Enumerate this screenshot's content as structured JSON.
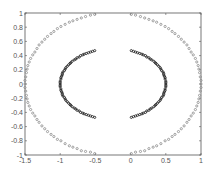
{
  "chart_data": {
    "type": "scatter",
    "title": "",
    "xlabel": "",
    "ylabel": "",
    "xlim": [
      -1.5,
      1
    ],
    "ylim": [
      -1,
      1
    ],
    "grid": false,
    "legend": null,
    "x_ticks": [
      -1.5,
      -1,
      -0.5,
      0,
      0.5,
      1
    ],
    "x_tick_labels": [
      "-1.5",
      "-1",
      "-0.5",
      "0",
      "0.5",
      "1"
    ],
    "y_ticks": [
      -1,
      -0.8,
      -0.6,
      -0.4,
      -0.2,
      0,
      0.2,
      0.4,
      0.6,
      0.8,
      1
    ],
    "y_tick_labels": [
      "-1",
      "-0.8",
      "-0.6",
      "-0.4",
      "-0.2",
      "0",
      "0.2",
      "0.4",
      "0.6",
      "0.8",
      "1"
    ],
    "series": [
      {
        "name": "outer-right",
        "color": "#8a8a8a",
        "marker": "circle",
        "points": [
          [
            0.01,
            -0.98
          ],
          [
            0.07,
            -0.96
          ],
          [
            0.14,
            -0.95
          ],
          [
            0.2,
            -0.94
          ],
          [
            0.26,
            -0.91
          ],
          [
            0.32,
            -0.89
          ],
          [
            0.37,
            -0.87
          ],
          [
            0.43,
            -0.84
          ],
          [
            0.49,
            -0.8
          ],
          [
            0.54,
            -0.78
          ],
          [
            0.59,
            -0.74
          ],
          [
            0.63,
            -0.71
          ],
          [
            0.68,
            -0.67
          ],
          [
            0.72,
            -0.63
          ],
          [
            0.76,
            -0.59
          ],
          [
            0.8,
            -0.54
          ],
          [
            0.83,
            -0.5
          ],
          [
            0.86,
            -0.45
          ],
          [
            0.89,
            -0.41
          ],
          [
            0.92,
            -0.36
          ],
          [
            0.94,
            -0.31
          ],
          [
            0.96,
            -0.26
          ],
          [
            0.97,
            -0.21
          ],
          [
            0.98,
            -0.16
          ],
          [
            0.99,
            -0.1
          ],
          [
            1.0,
            -0.05
          ],
          [
            1.0,
            0.0
          ],
          [
            1.0,
            0.05
          ],
          [
            0.99,
            0.1
          ],
          [
            0.98,
            0.16
          ],
          [
            0.97,
            0.21
          ],
          [
            0.96,
            0.26
          ],
          [
            0.94,
            0.31
          ],
          [
            0.92,
            0.36
          ],
          [
            0.89,
            0.41
          ],
          [
            0.86,
            0.45
          ],
          [
            0.83,
            0.5
          ],
          [
            0.8,
            0.55
          ],
          [
            0.76,
            0.59
          ],
          [
            0.72,
            0.63
          ],
          [
            0.68,
            0.67
          ],
          [
            0.63,
            0.71
          ],
          [
            0.59,
            0.74
          ],
          [
            0.54,
            0.78
          ],
          [
            0.49,
            0.81
          ],
          [
            0.43,
            0.84
          ],
          [
            0.37,
            0.87
          ],
          [
            0.32,
            0.89
          ],
          [
            0.26,
            0.91
          ],
          [
            0.2,
            0.93
          ],
          [
            0.14,
            0.95
          ],
          [
            0.07,
            0.97
          ],
          [
            0.01,
            0.98
          ]
        ]
      },
      {
        "name": "outer-left",
        "color": "#8a8a8a",
        "marker": "circle",
        "points": [
          [
            -0.51,
            -0.98
          ],
          [
            -0.57,
            -0.96
          ],
          [
            -0.64,
            -0.95
          ],
          [
            -0.7,
            -0.94
          ],
          [
            -0.76,
            -0.91
          ],
          [
            -0.82,
            -0.89
          ],
          [
            -0.87,
            -0.87
          ],
          [
            -0.93,
            -0.84
          ],
          [
            -0.99,
            -0.8
          ],
          [
            -1.04,
            -0.78
          ],
          [
            -1.09,
            -0.74
          ],
          [
            -1.13,
            -0.71
          ],
          [
            -1.18,
            -0.67
          ],
          [
            -1.22,
            -0.63
          ],
          [
            -1.26,
            -0.59
          ],
          [
            -1.3,
            -0.54
          ],
          [
            -1.33,
            -0.5
          ],
          [
            -1.36,
            -0.45
          ],
          [
            -1.39,
            -0.41
          ],
          [
            -1.42,
            -0.36
          ],
          [
            -1.44,
            -0.31
          ],
          [
            -1.46,
            -0.26
          ],
          [
            -1.47,
            -0.21
          ],
          [
            -1.48,
            -0.16
          ],
          [
            -1.49,
            -0.1
          ],
          [
            -1.5,
            -0.05
          ],
          [
            -1.5,
            0.0
          ],
          [
            -1.5,
            0.05
          ],
          [
            -1.49,
            0.1
          ],
          [
            -1.48,
            0.16
          ],
          [
            -1.47,
            0.21
          ],
          [
            -1.46,
            0.26
          ],
          [
            -1.44,
            0.31
          ],
          [
            -1.42,
            0.36
          ],
          [
            -1.39,
            0.41
          ],
          [
            -1.36,
            0.45
          ],
          [
            -1.33,
            0.5
          ],
          [
            -1.3,
            0.55
          ],
          [
            -1.26,
            0.59
          ],
          [
            -1.22,
            0.63
          ],
          [
            -1.18,
            0.67
          ],
          [
            -1.13,
            0.71
          ],
          [
            -1.09,
            0.74
          ],
          [
            -1.04,
            0.78
          ],
          [
            -0.99,
            0.81
          ],
          [
            -0.93,
            0.84
          ],
          [
            -0.87,
            0.87
          ],
          [
            -0.82,
            0.89
          ],
          [
            -0.76,
            0.91
          ],
          [
            -0.7,
            0.93
          ],
          [
            -0.64,
            0.95
          ],
          [
            -0.57,
            0.97
          ],
          [
            -0.51,
            0.98
          ]
        ]
      },
      {
        "name": "inner-right",
        "color": "#1a1a1a",
        "marker": "circle",
        "points": [
          [
            0.01,
            -0.47
          ],
          [
            0.04,
            -0.46
          ],
          [
            0.07,
            -0.45
          ],
          [
            0.1,
            -0.44
          ],
          [
            0.13,
            -0.43
          ],
          [
            0.16,
            -0.42
          ],
          [
            0.18,
            -0.41
          ],
          [
            0.21,
            -0.4
          ],
          [
            0.23,
            -0.38
          ],
          [
            0.26,
            -0.37
          ],
          [
            0.28,
            -0.35
          ],
          [
            0.3,
            -0.34
          ],
          [
            0.33,
            -0.32
          ],
          [
            0.35,
            -0.3
          ],
          [
            0.36,
            -0.29
          ],
          [
            0.38,
            -0.27
          ],
          [
            0.4,
            -0.25
          ],
          [
            0.42,
            -0.23
          ],
          [
            0.43,
            -0.21
          ],
          [
            0.44,
            -0.19
          ],
          [
            0.46,
            -0.17
          ],
          [
            0.47,
            -0.15
          ],
          [
            0.47,
            -0.13
          ],
          [
            0.48,
            -0.11
          ],
          [
            0.49,
            -0.09
          ],
          [
            0.49,
            -0.07
          ],
          [
            0.5,
            -0.04
          ],
          [
            0.5,
            -0.02
          ],
          [
            0.5,
            0.0
          ],
          [
            0.5,
            0.02
          ],
          [
            0.5,
            0.04
          ],
          [
            0.49,
            0.07
          ],
          [
            0.49,
            0.09
          ],
          [
            0.48,
            0.11
          ],
          [
            0.47,
            0.13
          ],
          [
            0.47,
            0.15
          ],
          [
            0.46,
            0.17
          ],
          [
            0.44,
            0.19
          ],
          [
            0.43,
            0.21
          ],
          [
            0.42,
            0.23
          ],
          [
            0.4,
            0.25
          ],
          [
            0.38,
            0.27
          ],
          [
            0.36,
            0.29
          ],
          [
            0.35,
            0.3
          ],
          [
            0.33,
            0.32
          ],
          [
            0.3,
            0.34
          ],
          [
            0.28,
            0.35
          ],
          [
            0.26,
            0.37
          ],
          [
            0.23,
            0.38
          ],
          [
            0.21,
            0.4
          ],
          [
            0.18,
            0.41
          ],
          [
            0.16,
            0.42
          ],
          [
            0.13,
            0.43
          ],
          [
            0.1,
            0.44
          ],
          [
            0.07,
            0.45
          ],
          [
            0.04,
            0.46
          ],
          [
            0.01,
            0.47
          ]
        ]
      },
      {
        "name": "inner-left",
        "color": "#1a1a1a",
        "marker": "circle",
        "points": [
          [
            -0.51,
            -0.47
          ],
          [
            -0.54,
            -0.46
          ],
          [
            -0.57,
            -0.45
          ],
          [
            -0.6,
            -0.44
          ],
          [
            -0.63,
            -0.43
          ],
          [
            -0.66,
            -0.42
          ],
          [
            -0.68,
            -0.41
          ],
          [
            -0.71,
            -0.4
          ],
          [
            -0.73,
            -0.38
          ],
          [
            -0.76,
            -0.37
          ],
          [
            -0.78,
            -0.35
          ],
          [
            -0.8,
            -0.34
          ],
          [
            -0.83,
            -0.32
          ],
          [
            -0.85,
            -0.3
          ],
          [
            -0.86,
            -0.29
          ],
          [
            -0.88,
            -0.27
          ],
          [
            -0.9,
            -0.25
          ],
          [
            -0.92,
            -0.23
          ],
          [
            -0.93,
            -0.21
          ],
          [
            -0.94,
            -0.19
          ],
          [
            -0.96,
            -0.17
          ],
          [
            -0.97,
            -0.15
          ],
          [
            -0.97,
            -0.13
          ],
          [
            -0.98,
            -0.11
          ],
          [
            -0.99,
            -0.09
          ],
          [
            -0.99,
            -0.07
          ],
          [
            -1.0,
            -0.04
          ],
          [
            -1.0,
            -0.02
          ],
          [
            -1.0,
            0.0
          ],
          [
            -1.0,
            0.02
          ],
          [
            -1.0,
            0.04
          ],
          [
            -0.99,
            0.07
          ],
          [
            -0.99,
            0.09
          ],
          [
            -0.98,
            0.11
          ],
          [
            -0.97,
            0.13
          ],
          [
            -0.97,
            0.15
          ],
          [
            -0.96,
            0.17
          ],
          [
            -0.94,
            0.19
          ],
          [
            -0.93,
            0.21
          ],
          [
            -0.92,
            0.23
          ],
          [
            -0.9,
            0.25
          ],
          [
            -0.88,
            0.27
          ],
          [
            -0.86,
            0.29
          ],
          [
            -0.85,
            0.3
          ],
          [
            -0.83,
            0.32
          ],
          [
            -0.8,
            0.34
          ],
          [
            -0.78,
            0.35
          ],
          [
            -0.76,
            0.37
          ],
          [
            -0.73,
            0.38
          ],
          [
            -0.71,
            0.4
          ],
          [
            -0.68,
            0.41
          ],
          [
            -0.66,
            0.42
          ],
          [
            -0.63,
            0.43
          ],
          [
            -0.6,
            0.44
          ],
          [
            -0.57,
            0.45
          ],
          [
            -0.54,
            0.46
          ],
          [
            -0.51,
            0.47
          ]
        ]
      }
    ]
  },
  "layout": {
    "plot_left": 25,
    "plot_top": 13,
    "plot_right": 201,
    "plot_bottom": 155,
    "axis_color": "#555555"
  }
}
